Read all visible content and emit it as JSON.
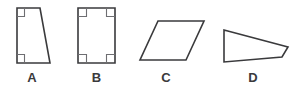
{
  "figure": {
    "kind": "geometry-quadrilaterals-diagram",
    "width": 303,
    "height": 86,
    "background_color": "#ffffff",
    "stroke_color": "#3a3a3c",
    "marker_color": "#6e6e72",
    "fill_color": "#ffffff",
    "label_color": "#3a3a3c"
  },
  "shapes": [
    {
      "label": "A",
      "name": "right-trapezoid",
      "points": "17,8 40,8 50,63 17,63",
      "label_x": 32,
      "label_y": 71,
      "right_angle_markers": [
        "17,16.5 24.5,16.5 24.5,8",
        "17,54.5 24.5,54.5 24.5,63"
      ]
    },
    {
      "label": "B",
      "name": "rectangle",
      "points": "78,8 115,8 115,63 78,63",
      "label_x": 96.5,
      "label_y": 71,
      "right_angle_markers": [
        "78,16.5 86.5,16.5 86.5,8",
        "115,16.5 106.5,16.5 106.5,8",
        "78,54.5 86.5,54.5 86.5,63",
        "115,54.5 106.5,54.5 106.5,63"
      ]
    },
    {
      "label": "C",
      "name": "parallelogram",
      "points": "158,21 204,21 186,60 140,60",
      "label_x": 166,
      "label_y": 71,
      "right_angle_markers": []
    },
    {
      "label": "D",
      "name": "irregular-quadrilateral",
      "points": "224,30 288,47 282,57 224,62",
      "label_x": 253,
      "label_y": 71,
      "right_angle_markers": []
    }
  ]
}
